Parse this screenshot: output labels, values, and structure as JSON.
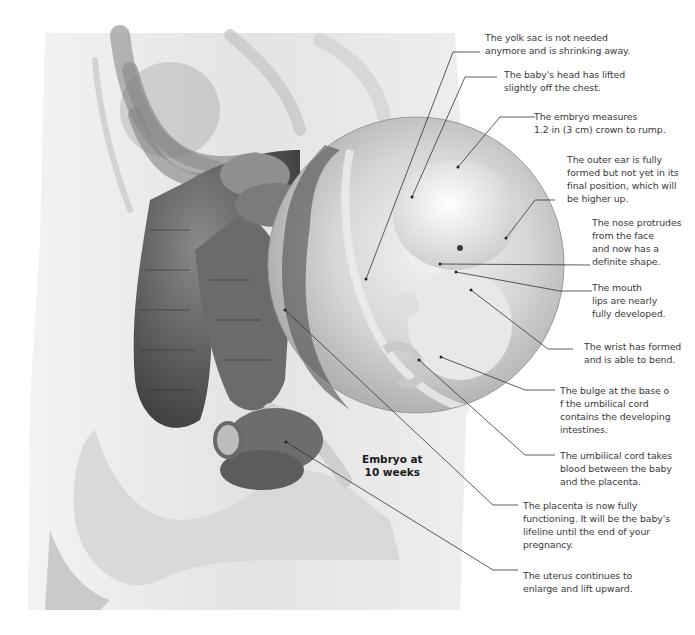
{
  "figure": {
    "caption_line1": "Embryo at",
    "caption_line2": "10 weeks",
    "colors": {
      "background": "#ffffff",
      "label_text": "#3a3a3a",
      "leader_line": "#333333",
      "torso": "#e4e4e4",
      "intestine": "#5a5a5a",
      "circle_inset": "#cfcfcf"
    }
  },
  "annotations": [
    {
      "id": "yolk-sac",
      "lines": [
        "The yolk sac is not needed",
        "anymore and is shrinking away."
      ]
    },
    {
      "id": "head",
      "lines": [
        "The baby's head has lifted",
        "slightly off the chest."
      ]
    },
    {
      "id": "size",
      "lines": [
        "The embryo measures",
        "1.2 in (3 cm) crown to rump."
      ]
    },
    {
      "id": "outer-ear",
      "lines": [
        "The outer ear is fully",
        "formed but not yet in its",
        "final position, which will",
        "be higher up."
      ]
    },
    {
      "id": "nose",
      "lines": [
        "The nose protrudes",
        "from the face",
        "and now has a",
        "definite shape."
      ]
    },
    {
      "id": "mouth",
      "lines": [
        "The mouth",
        "lips are nearly",
        "fully developed."
      ]
    },
    {
      "id": "wrist",
      "lines": [
        "The wrist has formed",
        "and is able to bend."
      ]
    },
    {
      "id": "bulge",
      "lines": [
        "The bulge at the base o",
        "f the umbilical cord",
        "contains the developing",
        "intestines."
      ]
    },
    {
      "id": "umbilical-cord",
      "lines": [
        "The umbilical cord takes",
        "blood between the baby",
        "and the placenta."
      ]
    },
    {
      "id": "placenta",
      "lines": [
        "The placenta is now fully",
        "functioning. It will be the baby's",
        "lifeline until the end of your",
        "pregnancy."
      ]
    },
    {
      "id": "uterus",
      "lines": [
        "The uterus continues to",
        "enlarge and lift upward."
      ]
    }
  ]
}
